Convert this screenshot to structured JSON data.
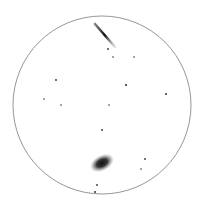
{
  "view": {
    "type": "eyepiece-sketch",
    "background": "#ffffff",
    "circle": {
      "cx": 102,
      "cy": 105,
      "r": 89,
      "stroke": "#8a8a8a"
    }
  },
  "objects": {
    "edge_on_galaxy": {
      "x1": 95,
      "y1": 24,
      "x2": 115,
      "y2": 47
    },
    "elliptical_galaxy": {
      "cx": 102,
      "cy": 163,
      "rx": 13,
      "ry": 8,
      "angle": -28
    },
    "stars": [
      {
        "x": 108,
        "y": 49,
        "r": 0.9
      },
      {
        "x": 113,
        "y": 57,
        "r": 0.8
      },
      {
        "x": 134,
        "y": 57,
        "r": 0.8
      },
      {
        "x": 56,
        "y": 80,
        "r": 0.9
      },
      {
        "x": 126,
        "y": 85,
        "r": 1.1
      },
      {
        "x": 166,
        "y": 94,
        "r": 1.0
      },
      {
        "x": 44,
        "y": 99,
        "r": 0.8
      },
      {
        "x": 61,
        "y": 105,
        "r": 0.8
      },
      {
        "x": 109,
        "y": 105,
        "r": 0.8
      },
      {
        "x": 102,
        "y": 130,
        "r": 0.9
      },
      {
        "x": 145,
        "y": 159,
        "r": 0.9
      },
      {
        "x": 141,
        "y": 169,
        "r": 0.8
      },
      {
        "x": 97,
        "y": 185,
        "r": 0.9
      },
      {
        "x": 95,
        "y": 192,
        "r": 1.0
      }
    ]
  }
}
